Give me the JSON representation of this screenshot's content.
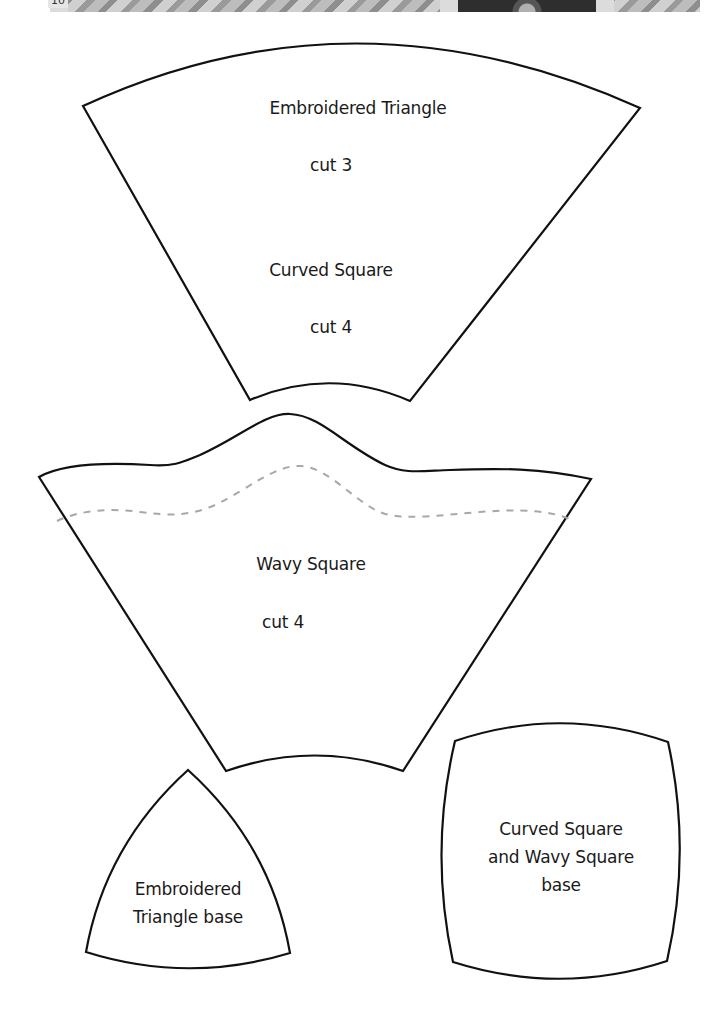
{
  "page": {
    "page_number": "10",
    "header_band": "decorative photo strip"
  },
  "colors": {
    "outline": "#111111",
    "stitch_line": "#a8a8a8",
    "text": "#1a1a1a",
    "background": "#ffffff"
  },
  "templates": {
    "curved_square_shape": {
      "lines": [
        "Embroidered Triangle",
        "cut 3",
        "Curved Square",
        "cut 4"
      ]
    },
    "wavy_square": {
      "lines": [
        "Wavy Square",
        "cut 4"
      ],
      "stitch_line": "dashed"
    },
    "triangle_base": {
      "lines": [
        "Embroidered",
        "Triangle base"
      ]
    },
    "square_base": {
      "lines": [
        "Curved Square",
        "and Wavy Square",
        "base"
      ]
    }
  }
}
